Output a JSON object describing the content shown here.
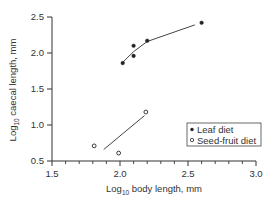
{
  "chart_data": {
    "type": "scatter",
    "title": "",
    "xlabel": "Log10 body length, mm",
    "ylabel": "Log10 caecal length, mm",
    "xlabel_parts": {
      "prefix": "Log",
      "sub": "10",
      "suffix": " body length, mm"
    },
    "ylabel_parts": {
      "prefix": "Log",
      "sub": "10",
      "suffix": " caecal length, mm"
    },
    "xlim": [
      1.5,
      3.0
    ],
    "ylim": [
      0.5,
      2.5
    ],
    "x_ticks": [
      1.5,
      2.0,
      2.5,
      3.0
    ],
    "x_tick_labels": [
      "1.5",
      "2.0",
      "2.5",
      "3.0"
    ],
    "x_minor_step": 0.1,
    "y_ticks": [
      0.5,
      1.0,
      1.5,
      2.0,
      2.5
    ],
    "y_tick_labels": [
      "0.5",
      "1.0",
      "1.5",
      "2.0",
      "2.5"
    ],
    "grid": false,
    "legend_position": "lower right",
    "series": [
      {
        "name": "Leaf diet",
        "marker": "filled-circle",
        "points": [
          {
            "x": 2.02,
            "y": 1.86
          },
          {
            "x": 2.1,
            "y": 2.1
          },
          {
            "x": 2.1,
            "y": 1.96
          },
          {
            "x": 2.2,
            "y": 2.17
          },
          {
            "x": 2.6,
            "y": 2.42
          }
        ],
        "fit_line": [
          {
            "x": 2.02,
            "y": 1.87
          },
          {
            "x": 2.1,
            "y": 2.02
          },
          {
            "x": 2.2,
            "y": 2.16
          },
          {
            "x": 2.55,
            "y": 2.39
          }
        ]
      },
      {
        "name": "Seed-fruit diet",
        "marker": "open-circle",
        "points": [
          {
            "x": 1.81,
            "y": 0.71
          },
          {
            "x": 1.99,
            "y": 0.61
          },
          {
            "x": 2.19,
            "y": 1.18
          }
        ],
        "fit_line": [
          {
            "x": 1.88,
            "y": 0.66
          },
          {
            "x": 2.18,
            "y": 1.13
          }
        ]
      }
    ]
  },
  "legend": {
    "items": [
      {
        "label": "Leaf diet",
        "marker": "filled-circle"
      },
      {
        "label": "Seed-fruit diet",
        "marker": "open-circle"
      }
    ]
  }
}
